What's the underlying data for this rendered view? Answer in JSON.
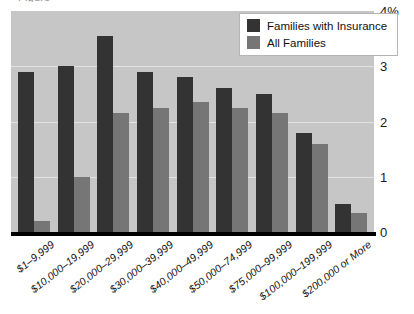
{
  "chart_data": {
    "type": "bar",
    "title": "",
    "xlabel": "",
    "ylabel": "",
    "ylim": [
      0,
      4
    ],
    "yticks": [
      0,
      1,
      2,
      3,
      4
    ],
    "ytick_labels": [
      "0",
      "1",
      "2",
      "3",
      "4%"
    ],
    "grid": true,
    "legend_position": "top-right",
    "categories": [
      "$1–9,999",
      "$10,000–19,999",
      "$20,000–29,999",
      "$30,000–39,999",
      "$40,000–49,999",
      "$50,000–74,999",
      "$75,000–99,999",
      "$100,000–199,999",
      "$200,000 or More"
    ],
    "series": [
      {
        "name": "Families with Insurance",
        "color": "#333333",
        "values": [
          2.9,
          3.0,
          3.55,
          2.9,
          2.8,
          2.6,
          2.5,
          1.8,
          0.5
        ]
      },
      {
        "name": "All Families",
        "color": "#767676",
        "values": [
          0.2,
          1.0,
          2.15,
          2.25,
          2.35,
          2.25,
          2.15,
          1.6,
          0.35
        ]
      }
    ]
  },
  "legend": {
    "entries": [
      {
        "label": "Families with Insurance"
      },
      {
        "label": "All Families"
      }
    ]
  },
  "colors": {
    "series_dark": "#333333",
    "series_gray": "#767676",
    "plot_background": "#c6c6c6",
    "gridline": "#e2e2e2",
    "axis": "#000000"
  },
  "title_sliver": "Figure"
}
